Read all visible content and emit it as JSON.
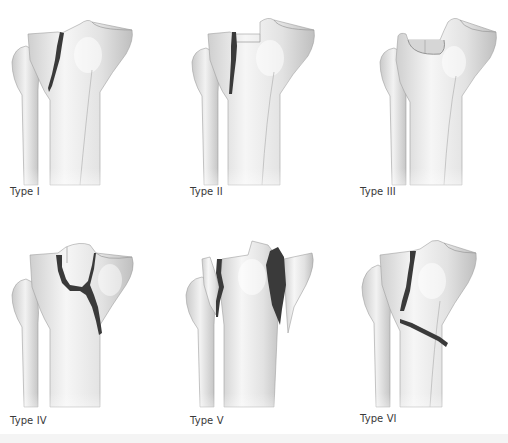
{
  "figure": {
    "panels": [
      {
        "id": "type-1",
        "label": "Type I",
        "description": "Lateral split fracture"
      },
      {
        "id": "type-2",
        "label": "Type II",
        "description": "Lateral split-depression fracture"
      },
      {
        "id": "type-3",
        "label": "Type III",
        "description": "Lateral pure depression fracture"
      },
      {
        "id": "type-4",
        "label": "Type IV",
        "description": "Medial plateau fracture"
      },
      {
        "id": "type-5",
        "label": "Type V",
        "description": "Bicondylar fracture"
      },
      {
        "id": "type-6",
        "label": "Type VI",
        "description": "Plateau fracture with metaphyseal-diaphyseal dissociation"
      }
    ]
  },
  "colors": {
    "background": "#ffffff",
    "bone_fill": "#e6e6e6",
    "bone_highlight": "#f7f7f7",
    "bone_shadow": "#c8c8c8",
    "bone_outline": "#9a9a9a",
    "fracture": "#3a3a3a",
    "label_text": "#3a3a3a"
  }
}
